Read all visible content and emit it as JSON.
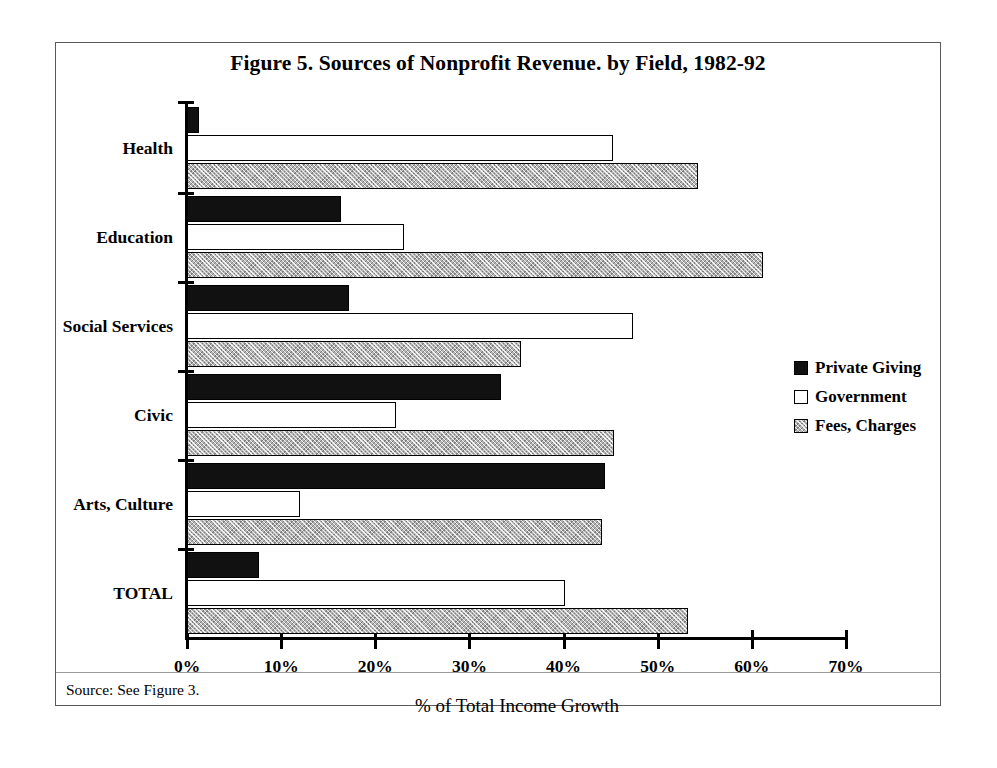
{
  "figure": {
    "title": "Figure 5. Sources of Nonprofit Revenue. by Field, 1982-92",
    "source_note": "Source: See Figure 3.",
    "x_axis_title": "% of Total Income Growth"
  },
  "legend": {
    "position": "right-middle",
    "entries": [
      {
        "label": "Private Giving",
        "swatch": "solid-black-swatch"
      },
      {
        "label": "Government",
        "swatch": "white-outline-swatch"
      },
      {
        "label": "Fees, Charges",
        "swatch": "gray-hatched-swatch"
      }
    ]
  },
  "chart_data": {
    "type": "bar",
    "orientation": "horizontal",
    "title": "Figure 5. Sources of Nonprofit Revenue. by Field, 1982-92",
    "xlabel": "% of Total Income Growth",
    "ylabel": "",
    "xlim": [
      0,
      70
    ],
    "xticks": [
      0,
      10,
      20,
      30,
      40,
      50,
      60,
      70
    ],
    "xtick_labels": [
      "0%",
      "10%",
      "20%",
      "30%",
      "40%",
      "50%",
      "60%",
      "70%"
    ],
    "grid": false,
    "legend_position": "right",
    "categories": [
      "Health",
      "Education",
      "Social Services",
      "Civic",
      "Arts, Culture",
      "TOTAL"
    ],
    "series": [
      {
        "name": "Private Giving",
        "values": [
          1.3,
          16.4,
          17.2,
          33.4,
          44.4,
          7.7
        ]
      },
      {
        "name": "Government",
        "values": [
          45.3,
          23.1,
          47.4,
          22.2,
          12.0,
          40.1
        ]
      },
      {
        "name": "Fees, Charges",
        "values": [
          54.3,
          61.2,
          35.5,
          45.4,
          44.1,
          53.2
        ]
      }
    ]
  }
}
